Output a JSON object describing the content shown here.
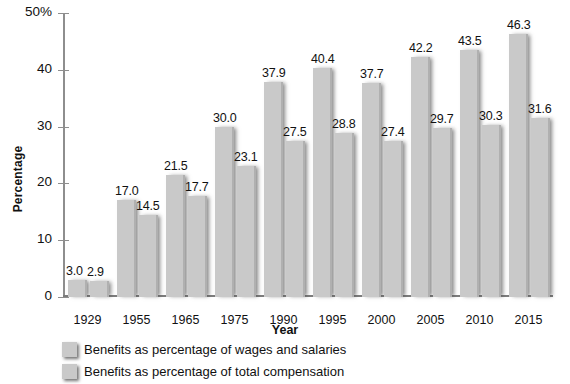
{
  "chart_data": {
    "type": "bar",
    "title": "",
    "xlabel": "Year",
    "ylabel": "Percentage",
    "ylim": [
      0,
      50
    ],
    "yticks": [
      0,
      10,
      20,
      30,
      40,
      50
    ],
    "ytick_labels": [
      "0",
      "10",
      "20",
      "30",
      "40",
      "50%"
    ],
    "grid": false,
    "legend_position": "bottom-left",
    "categories": [
      "1929",
      "1955",
      "1965",
      "1975",
      "1990",
      "1995",
      "2000",
      "2005",
      "2010",
      "2015"
    ],
    "series": [
      {
        "name": "Benefits as percentage of wages and salaries",
        "values": [
          3.0,
          17.0,
          21.5,
          30.0,
          37.9,
          40.4,
          37.7,
          42.2,
          43.5,
          46.3
        ],
        "labels": [
          "3.0",
          "17.0",
          "21.5",
          "30.0",
          "37.9",
          "40.4",
          "37.7",
          "42.2",
          "43.5",
          "46.3"
        ],
        "color": "#c9c9c9"
      },
      {
        "name": "Benefits as percentage of total compensation",
        "values": [
          2.9,
          14.5,
          17.7,
          23.1,
          27.5,
          28.8,
          27.4,
          29.7,
          30.3,
          31.6
        ],
        "labels": [
          "2.9",
          "14.5",
          "17.7",
          "23.1",
          "27.5",
          "28.8",
          "27.4",
          "29.7",
          "30.3",
          "31.6"
        ],
        "color": "#c9c9c9"
      }
    ]
  },
  "legend": {
    "items": [
      {
        "label": "Benefits as percentage of wages and salaries",
        "swatch_color": "#c9c9c9"
      },
      {
        "label": "Benefits as percentage of total compensation",
        "swatch_color": "#c9c9c9"
      }
    ]
  },
  "colors": {
    "bar": "#c9c9c9",
    "axis": "#8e8e8e",
    "text": "#111111",
    "background": "#ffffff"
  }
}
